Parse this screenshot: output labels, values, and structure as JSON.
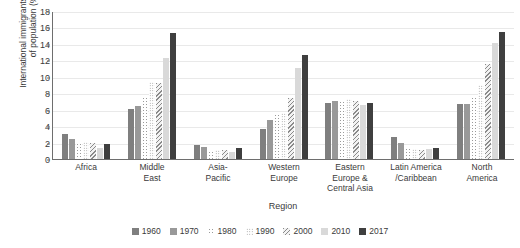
{
  "chart_data": {
    "type": "bar",
    "title": "",
    "xlabel": "Region",
    "ylabel": "International immigrants as share\nof population (%)",
    "ylim": [
      0,
      18
    ],
    "yticks": [
      0,
      2,
      4,
      6,
      8,
      10,
      12,
      14,
      16,
      18
    ],
    "grid": true,
    "legend_position": "bottom",
    "categories": [
      "Africa",
      "Middle\nEast",
      "Asia-\nPacific",
      "Western\nEurope",
      "Eastern\nEurope &\nCentral Asia",
      "Latin America\n/Caribbean",
      "North\nAmerica"
    ],
    "series": [
      {
        "name": "1960",
        "values": [
          3.1,
          6.1,
          1.7,
          3.6,
          6.8,
          2.7,
          6.7
        ]
      },
      {
        "name": "1970",
        "values": [
          2.4,
          6.4,
          1.5,
          4.7,
          7.1,
          1.9,
          6.7
        ]
      },
      {
        "name": "1980",
        "values": [
          2.0,
          7.5,
          1.0,
          5.5,
          7.0,
          1.4,
          7.6
        ]
      },
      {
        "name": "1990",
        "values": [
          2.1,
          9.4,
          1.1,
          5.6,
          7.3,
          1.2,
          9.0
        ]
      },
      {
        "name": "2000",
        "values": [
          1.9,
          9.3,
          1.1,
          7.4,
          7.1,
          1.1,
          11.6
        ]
      },
      {
        "name": "2010",
        "values": [
          1.4,
          12.3,
          0.9,
          11.1,
          6.6,
          1.2,
          14.1
        ]
      },
      {
        "name": "2017",
        "values": [
          1.8,
          15.3,
          1.3,
          12.7,
          6.8,
          1.4,
          15.4
        ]
      }
    ]
  },
  "colors": {
    "series_1960": "#7f7f7f",
    "series_1970": "#999999",
    "series_1980": "#9a9a9a",
    "series_1990": "#8f8f8f",
    "series_2000": "#8a8a8a",
    "series_2010": "#d9d9d9",
    "series_2017": "#3f3f3f",
    "axis": "#6e6e6e",
    "gridline": "#e9e9e9",
    "text": "#3a3a3a",
    "background": "#ffffff"
  }
}
